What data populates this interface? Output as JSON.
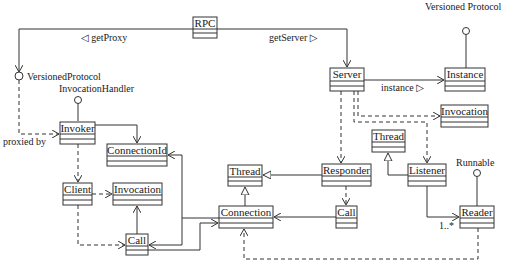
{
  "diagram": {
    "type": "UML class diagram",
    "classes": [
      {
        "id": "rpc",
        "name": "RPC"
      },
      {
        "id": "server",
        "name": "Server"
      },
      {
        "id": "instance",
        "name": "Instance"
      },
      {
        "id": "invocation_server",
        "name": "Invocation"
      },
      {
        "id": "thread_listener",
        "name": "Thread"
      },
      {
        "id": "listener",
        "name": "Listener"
      },
      {
        "id": "reader",
        "name": "Reader"
      },
      {
        "id": "responder",
        "name": "Responder"
      },
      {
        "id": "call_server",
        "name": "Call"
      },
      {
        "id": "thread_connection",
        "name": "Thread"
      },
      {
        "id": "connection",
        "name": "Connection"
      },
      {
        "id": "invoker",
        "name": "Invoker"
      },
      {
        "id": "connection_id",
        "name": "ConnectionId"
      },
      {
        "id": "client",
        "name": "Client"
      },
      {
        "id": "invocation_client",
        "name": "Invocation"
      },
      {
        "id": "call_client",
        "name": "Call"
      }
    ],
    "interfaces": [
      {
        "id": "versioned_protocol_left",
        "name": "VersionedProtocol"
      },
      {
        "id": "invocation_handler",
        "name": "InvocationHandler"
      },
      {
        "id": "versioned_protocol_right",
        "name": "Versioned Protocol"
      },
      {
        "id": "runnable",
        "name": "Runnable"
      }
    ],
    "labels": {
      "get_proxy": "◁ getProxy",
      "get_server": "getServer ▷",
      "instance": "instance ▷",
      "proxied_by": "proxied by",
      "multiplicity": "1..*"
    },
    "relations": [
      {
        "from": "RPC",
        "to": "VersionedProtocol",
        "kind": "association",
        "label": "getProxy"
      },
      {
        "from": "RPC",
        "to": "Server",
        "kind": "association",
        "label": "getServer"
      },
      {
        "from": "Server",
        "to": "Instance",
        "kind": "association",
        "label": "instance"
      },
      {
        "from": "Server",
        "to": "Invocation",
        "kind": "dependency"
      },
      {
        "from": "Server",
        "to": "Listener",
        "kind": "dependency"
      },
      {
        "from": "Server",
        "to": "Responder",
        "kind": "dependency"
      },
      {
        "from": "Listener",
        "to": "Thread",
        "kind": "generalization"
      },
      {
        "from": "Listener",
        "to": "Reader",
        "kind": "association",
        "multiplicity": "1..*"
      },
      {
        "from": "Reader",
        "to": "Runnable",
        "kind": "realization"
      },
      {
        "from": "Reader",
        "to": "Connection",
        "kind": "dependency"
      },
      {
        "from": "Responder",
        "to": "Thread",
        "kind": "generalization"
      },
      {
        "from": "Responder",
        "to": "Call",
        "kind": "dependency"
      },
      {
        "from": "Call",
        "to": "Connection",
        "kind": "association"
      },
      {
        "from": "Connection",
        "to": "Thread",
        "kind": "generalization"
      },
      {
        "from": "Instance",
        "to": "Versioned Protocol",
        "kind": "realization"
      },
      {
        "from": "VersionedProtocol",
        "to": "Invoker",
        "kind": "dependency",
        "label": "proxied by"
      },
      {
        "from": "Invoker",
        "to": "InvocationHandler",
        "kind": "realization"
      },
      {
        "from": "Invoker",
        "to": "ConnectionId",
        "kind": "association"
      },
      {
        "from": "Invoker",
        "to": "Client",
        "kind": "dependency"
      },
      {
        "from": "Client",
        "to": "Invocation",
        "kind": "dependency"
      },
      {
        "from": "Client",
        "to": "Call",
        "kind": "dependency"
      },
      {
        "from": "Call",
        "to": "Invocation",
        "kind": "association"
      },
      {
        "from": "Connection",
        "to": "ConnectionId",
        "kind": "association"
      },
      {
        "from": "Connection",
        "to": "Call",
        "kind": "association"
      },
      {
        "from": "Call",
        "to": "Connection",
        "kind": "association"
      }
    ]
  }
}
